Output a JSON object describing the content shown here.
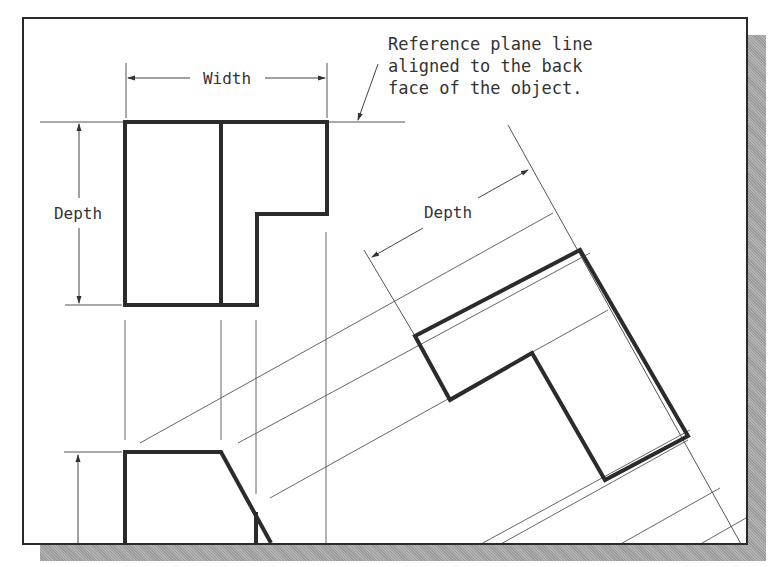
{
  "figure": {
    "type": "orthographic-auxiliary-view-diagram",
    "labels": {
      "width": "Width",
      "depth_top_view": "Depth",
      "depth_aux_view": "Depth"
    },
    "annotation": {
      "line1": "Reference plane line",
      "line2": "aligned to the back",
      "line3": "face of the object."
    },
    "views": [
      "top-view",
      "front-view",
      "auxiliary-view"
    ],
    "colors": {
      "object_line": "#2b2b2b",
      "thin_line": "#555555",
      "frame": "#2a2a2a",
      "shadow": "#a8a8a8",
      "background": "#ffffff"
    }
  }
}
